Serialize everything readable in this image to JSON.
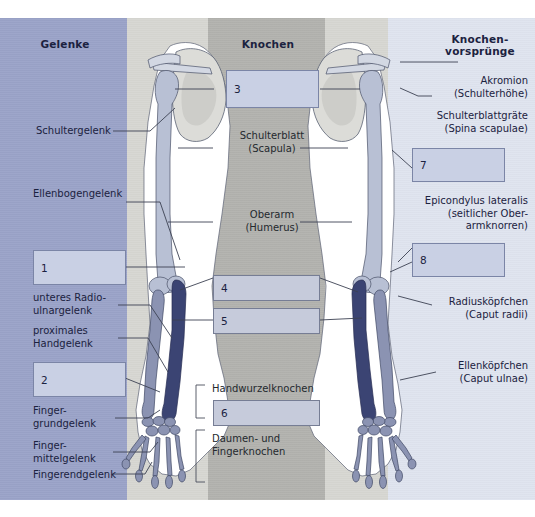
{
  "figure": {
    "columns": {
      "joints_heading": "Gelenke",
      "bones_heading": "Knochen",
      "processes_heading": "Knochen-\nvorsprünge"
    },
    "colors": {
      "band_joints": "#9aa3c8",
      "band_gap": "#d7d7d2",
      "band_bones": "#b2b2ae",
      "band_processes": "#dfe4ef",
      "answer_box_fill": "#c9d0e4",
      "answer_box_border": "#7b85a6",
      "text": "#1b2240",
      "bone_light": "#b8c0d4",
      "bone_dark": "#3b4473",
      "scapula": "#dcdcd8",
      "leader_line": "#3c4252"
    }
  },
  "left_column": {
    "labels": [
      {
        "id": "schultergelenk",
        "text": "Schultergelenk"
      },
      {
        "id": "ellenbogengelenk",
        "text": "Ellenbogengelenk"
      },
      {
        "id": "unteres-radioulnar",
        "text": "unteres Radio-\nulnargelenk"
      },
      {
        "id": "proximales-hand",
        "text": "proximales\nHandgelenk"
      },
      {
        "id": "fingergrundgelenk",
        "text": "Finger-\ngrundgelenk"
      },
      {
        "id": "fingermittelgelenk",
        "text": "Finger-\nmittelgelenk"
      },
      {
        "id": "fingerendgelenk",
        "text": "Fingerendgelenk"
      }
    ],
    "boxes": [
      {
        "id": "box-1",
        "number": "1"
      },
      {
        "id": "box-2",
        "number": "2"
      }
    ]
  },
  "center_column": {
    "labels": [
      {
        "id": "schulterblatt",
        "text": "Schulterblatt\n(Scapula)"
      },
      {
        "id": "oberarm",
        "text": "Oberarm\n(Humerus)"
      },
      {
        "id": "handwurzelknochen",
        "text": "Handwurzelknochen"
      },
      {
        "id": "daumen-fingerknochen",
        "text": "Daumen- und\nFingerknochen"
      }
    ],
    "boxes": [
      {
        "id": "box-3",
        "number": "3"
      },
      {
        "id": "box-4",
        "number": "4"
      },
      {
        "id": "box-5",
        "number": "5"
      },
      {
        "id": "box-6",
        "number": "6"
      }
    ]
  },
  "right_column": {
    "labels": [
      {
        "id": "akromion",
        "text": "Akromion\n(Schulterhöhe)"
      },
      {
        "id": "schulterblattgraete",
        "text": "Schulterblattgräte\n(Spina scapulae)"
      },
      {
        "id": "epicondylus-lateralis",
        "text": "Epicondylus lateralis\n(seitlicher Ober-\narmknorren)"
      },
      {
        "id": "radiuskoepfchen",
        "text": "Radiusköpfchen\n(Caput radii)"
      },
      {
        "id": "ellenkoepfchen",
        "text": "Ellenköpfchen\n(Caput ulnae)"
      }
    ],
    "boxes": [
      {
        "id": "box-7",
        "number": "7"
      },
      {
        "id": "box-8",
        "number": "8"
      }
    ]
  }
}
